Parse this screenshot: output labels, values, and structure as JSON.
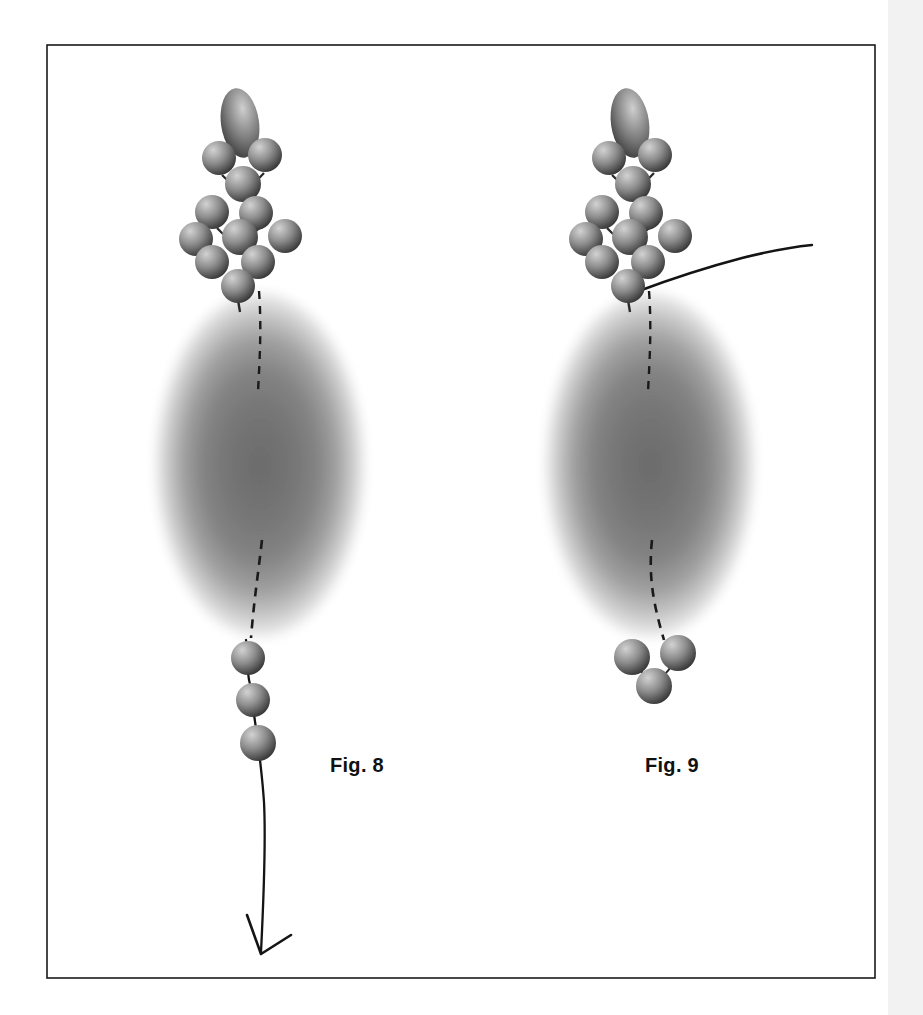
{
  "sheet": {
    "name": "patent-drawing-sheet",
    "background_color": "#ffffff",
    "width": 923,
    "height": 1015,
    "border": {
      "color": "#1a1a1a",
      "stroke_width": 1.6,
      "x": 47,
      "y": 45,
      "width": 828,
      "height": 933
    },
    "right_edge_strip": {
      "color": "#f2f2f2",
      "x": 888,
      "width": 35
    }
  },
  "captions": {
    "fig8": "Fig. 8",
    "fig9": "Fig. 9"
  },
  "palette": {
    "sphere_light": "#c8c8c8",
    "sphere_mid": "#8a8a8a",
    "sphere_dark": "#3e3e3e",
    "sphere_edge": "#2b2b2b",
    "ellipse_core": "#6e6e6e",
    "ellipse_rim": "#ffffff",
    "line_color": "#141414",
    "dash_color": "#1a1a1a",
    "caption_color": "#111111"
  },
  "figures": [
    {
      "id": "fig8",
      "label": "Fig. 8",
      "center_x": 260,
      "caption": {
        "x": 330,
        "y": 772
      },
      "body_ellipse": {
        "cx": 260,
        "cy": 465,
        "rx": 107,
        "ry": 175
      },
      "dashed_path": "M 259 291 C 262 330 259 370 258 392 M 262 540 C 258 575 254 600 251 638",
      "head_ellipsoid": {
        "cx": 240,
        "cy": 123,
        "rx": 19,
        "ry": 34,
        "rotate": -8
      },
      "head_spheres": [
        {
          "cx": 219,
          "cy": 158,
          "r": 17
        },
        {
          "cx": 265,
          "cy": 155,
          "r": 17
        },
        {
          "cx": 243,
          "cy": 184,
          "r": 18
        },
        {
          "cx": 212,
          "cy": 212,
          "r": 17
        },
        {
          "cx": 256,
          "cy": 213,
          "r": 17
        },
        {
          "cx": 196,
          "cy": 239,
          "r": 17
        },
        {
          "cx": 240,
          "cy": 237,
          "r": 18
        },
        {
          "cx": 285,
          "cy": 236,
          "r": 17
        },
        {
          "cx": 212,
          "cy": 262,
          "r": 17
        },
        {
          "cx": 258,
          "cy": 262,
          "r": 17
        },
        {
          "cx": 238,
          "cy": 286,
          "r": 17
        }
      ],
      "head_connectors": [
        "M 222 175 Q 243 196 264 173",
        "M 217 228 Q 238 250 259 228"
      ],
      "tail_spheres": [
        {
          "cx": 248,
          "cy": 658,
          "r": 17
        },
        {
          "cx": 253,
          "cy": 700,
          "r": 17
        },
        {
          "cx": 258,
          "cy": 743,
          "r": 18
        }
      ],
      "tail_line": "M 246 640 C 249 650 246 672 250 684 C 252 696 254 716 256 726 C 258 742 262 770 264 800 C 266 840 264 890 261 950",
      "arrow_head": "M 248 916 L 261 954 L 290 936",
      "top_line": null
    },
    {
      "id": "fig9",
      "label": "Fig. 9",
      "center_x": 650,
      "caption": {
        "x": 645,
        "y": 772
      },
      "body_ellipse": {
        "cx": 650,
        "cy": 465,
        "rx": 107,
        "ry": 175
      },
      "dashed_path": "M 649 291 C 652 330 649 370 648 392 M 652 540 C 648 575 654 600 662 638",
      "head_ellipsoid": {
        "cx": 630,
        "cy": 123,
        "rx": 19,
        "ry": 34,
        "rotate": -8
      },
      "head_spheres": [
        {
          "cx": 609,
          "cy": 158,
          "r": 17
        },
        {
          "cx": 655,
          "cy": 155,
          "r": 17
        },
        {
          "cx": 633,
          "cy": 184,
          "r": 18
        },
        {
          "cx": 602,
          "cy": 212,
          "r": 17
        },
        {
          "cx": 646,
          "cy": 213,
          "r": 17
        },
        {
          "cx": 586,
          "cy": 239,
          "r": 17
        },
        {
          "cx": 630,
          "cy": 237,
          "r": 18
        },
        {
          "cx": 675,
          "cy": 236,
          "r": 17
        },
        {
          "cx": 602,
          "cy": 262,
          "r": 17
        },
        {
          "cx": 648,
          "cy": 262,
          "r": 17
        },
        {
          "cx": 628,
          "cy": 286,
          "r": 17
        }
      ],
      "head_connectors": [
        "M 612 175 Q 633 196 654 173",
        "M 607 228 Q 628 250 649 228"
      ],
      "tail_spheres": [
        {
          "cx": 632,
          "cy": 657,
          "r": 18
        },
        {
          "cx": 678,
          "cy": 653,
          "r": 18
        },
        {
          "cx": 654,
          "cy": 685,
          "r": 18
        }
      ],
      "tail_line": null,
      "arrow_head": null,
      "top_line": "M 638 290 C 660 282 700 268 740 258 C 768 251 790 247 810 245"
    }
  ]
}
